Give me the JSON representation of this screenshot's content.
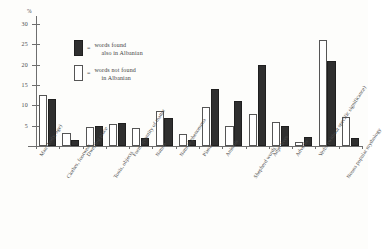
{
  "chart_data": {
    "type": "bar",
    "title": "",
    "subtitle": "",
    "xlabel": "",
    "ylabel": "%",
    "ylim": [
      0,
      32
    ],
    "yticks": [
      5,
      10,
      15,
      20,
      25,
      30
    ],
    "grid": false,
    "legend_position": "upper-center",
    "categories": [
      "Man (body, age)",
      "Clothes, footwear",
      "Dwelling place",
      "Tools, objects",
      "Form, quantity of matter",
      "Nature",
      "Natural phenomena",
      "Plants",
      "Animals",
      "Shepherd words",
      "Adjectives",
      "Adverbs",
      "Verbs (without specific significance)",
      "Nouns popular mythology"
    ],
    "series": [
      {
        "name": "words not found in Albanian",
        "style": "open",
        "values": [
          12.5,
          3.2,
          4.7,
          5.5,
          4.5,
          8.5,
          3.0,
          9.5,
          5.0,
          8.0,
          6.0,
          1.0,
          26.0,
          7.2
        ]
      },
      {
        "name": "words found also in Albanian",
        "style": "filled",
        "values": [
          11.5,
          1.5,
          5.0,
          5.7,
          2.0,
          7.0,
          1.5,
          14.0,
          11.0,
          20.0,
          5.0,
          2.2,
          21.0,
          2.0
        ]
      }
    ]
  },
  "y_axis": {
    "unit_label": "%",
    "ticks": [
      {
        "value": 30,
        "label": "30"
      },
      {
        "value": 25,
        "label": "25"
      },
      {
        "value": 20,
        "label": "20"
      },
      {
        "value": 15,
        "label": "15"
      },
      {
        "value": 10,
        "label": "10"
      },
      {
        "value": 5,
        "label": "5"
      }
    ]
  },
  "legend": {
    "items": [
      {
        "swatch": "filled",
        "equals": "=",
        "line1": "words found",
        "line2": "also in Albanian"
      },
      {
        "swatch": "open",
        "equals": "=",
        "line1": "words not found",
        "line2": "in Albanian"
      }
    ]
  }
}
